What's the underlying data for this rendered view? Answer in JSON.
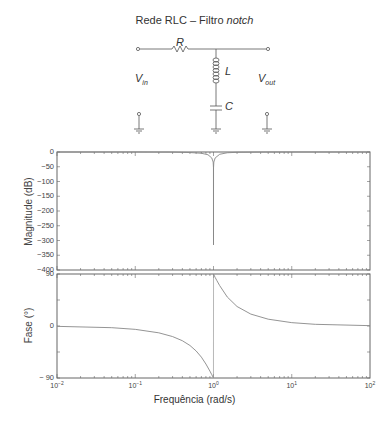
{
  "circuit": {
    "title_prefix": "Rede RLC – Filtro ",
    "title_italic": "notch",
    "labels": {
      "R": "R",
      "L": "L",
      "C": "C",
      "vin": "V",
      "vin_sub": "in",
      "vout": "V",
      "vout_sub": "out"
    }
  },
  "chart_data": [
    {
      "type": "line",
      "title": "Magnitude",
      "xlabel": "Frequência (rad/s)",
      "ylabel": "Magnitude (dB)",
      "xscale": "log",
      "xlim": [
        0.01,
        100
      ],
      "ylim": [
        -400,
        0
      ],
      "yticks": [
        0,
        -50,
        -100,
        -150,
        -200,
        -250,
        -300,
        -350,
        -400
      ],
      "ytick_labels": [
        "0",
        "−50",
        "−100",
        "−150",
        "−200",
        "−250",
        "−300",
        "−350",
        "−400"
      ],
      "x": [
        0.01,
        0.1,
        0.3,
        0.5,
        0.7,
        0.85,
        0.95,
        0.99,
        0.999,
        1.0,
        1.001,
        1.01,
        1.05,
        1.2,
        1.5,
        2,
        5,
        10,
        100
      ],
      "values": [
        0,
        -0.04,
        -0.4,
        -1.9,
        -4.3,
        -9.3,
        -20.2,
        -34.0,
        -54.0,
        -315,
        -54.0,
        -34.0,
        -20.2,
        -7.7,
        -2.6,
        -1.0,
        -0.09,
        -0.02,
        0
      ]
    },
    {
      "type": "line",
      "title": "Fase",
      "xlabel": "Frequência (rad/s)",
      "ylabel": "Fase (°)",
      "xscale": "log",
      "xlim": [
        0.01,
        100
      ],
      "ylim": [
        -90,
        90
      ],
      "yticks": [
        90,
        0,
        -90
      ],
      "ytick_labels": [
        "90",
        "0",
        "− 90"
      ],
      "xticks": [
        0.01,
        0.1,
        1,
        10,
        100
      ],
      "xtick_labels": [
        [
          "10",
          "−2"
        ],
        [
          "10",
          "−1"
        ],
        [
          "10",
          "0"
        ],
        [
          "10",
          "1"
        ],
        [
          "10",
          "2"
        ]
      ],
      "x": [
        0.01,
        0.05,
        0.1,
        0.2,
        0.3,
        0.4,
        0.5,
        0.6,
        0.7,
        0.8,
        0.9,
        0.95,
        0.999,
        1.001,
        1.05,
        1.1,
        1.2,
        1.5,
        2,
        3,
        5,
        10,
        20,
        100
      ],
      "values": [
        -0.6,
        -2.9,
        -5.8,
        -11.8,
        -18.3,
        -25.5,
        -33.7,
        -43.2,
        -53.9,
        -65.8,
        -78.1,
        -84.2,
        -89.9,
        89.9,
        84.0,
        79.0,
        69.9,
        50.2,
        33.7,
        20.6,
        11.8,
        5.8,
        2.9,
        0.6
      ]
    }
  ],
  "axes": {
    "xlabel": "Frequência (rad/s)",
    "mag_ylabel": "Magnitude (dB)",
    "phase_ylabel": "Fase (°)"
  }
}
